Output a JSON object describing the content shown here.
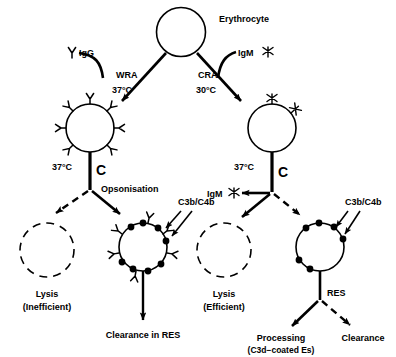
{
  "diagram": {
    "title_node": {
      "label": "Erythrocyte"
    },
    "pathways": {
      "left": {
        "antibody_label": "IgG",
        "antibody_icon": "igg-y-icon",
        "mechanism": "WRA",
        "temperature": "37°C",
        "binding_temperature": "37°C",
        "complement_symbol": "C",
        "process_label": "Opsonisation",
        "complement_fragment_label": "C3b/C4b",
        "lysis_label": "Lysis",
        "lysis_qualifier": "(Inefficient)",
        "outcome_label": "Clearance in RES"
      },
      "right": {
        "antibody_label": "IgM",
        "antibody_icon": "igm-star-icon",
        "mechanism": "CRA",
        "temperature": "30°C",
        "binding_temperature": "37°C",
        "complement_symbol": "C",
        "elution_label": "IgM",
        "elution_icon": "igm-star-icon",
        "complement_fragment_label": "C3b/C4b",
        "lysis_label": "Lysis",
        "lysis_qualifier": "(Efficient)",
        "res_label": "RES",
        "outcome_processing_label": "Processing",
        "outcome_processing_sub": "(C3d−coated Es)",
        "outcome_clearance_label": "Clearance"
      }
    },
    "colors": {
      "ink": "#000000",
      "paper": "#ffffff"
    }
  }
}
